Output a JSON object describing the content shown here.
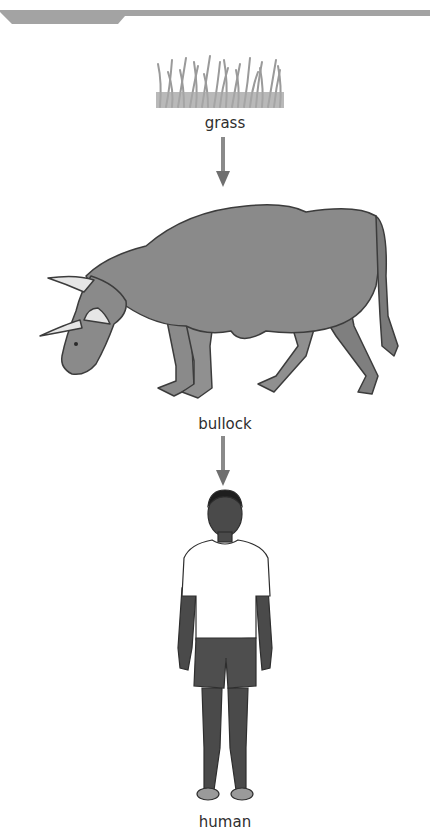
{
  "diagram": {
    "type": "food-chain",
    "nodes": [
      {
        "id": "grass",
        "label": "grass",
        "icon": "grass-icon"
      },
      {
        "id": "bullock",
        "label": "bullock",
        "icon": "bullock-icon"
      },
      {
        "id": "human",
        "label": "human",
        "icon": "human-icon"
      }
    ],
    "edges": [
      {
        "from": "grass",
        "to": "bullock"
      },
      {
        "from": "bullock",
        "to": "human"
      }
    ]
  },
  "colors": {
    "header_bar": "#a3a3a3",
    "arrow": "#6f6f6f",
    "bullock_body": "#8a8a8a",
    "grass": "#9a9a9a",
    "skin": "#4a4a4a",
    "shirt": "#ffffff",
    "shorts": "#4e4e4e"
  }
}
